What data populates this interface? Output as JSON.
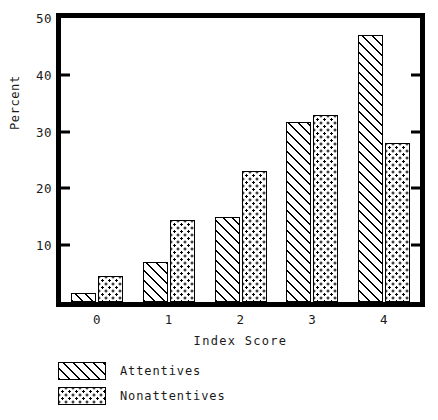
{
  "chart_data": {
    "type": "bar",
    "title": "",
    "xlabel": "Index Score",
    "ylabel": "Percent",
    "categories": [
      "0",
      "1",
      "2",
      "3",
      "4"
    ],
    "series": [
      {
        "name": "Attentives",
        "pattern": "diagonal-hatch",
        "values": [
          1.5,
          7.0,
          15.0,
          31.7,
          47.0
        ]
      },
      {
        "name": "Nonattentives",
        "pattern": "dotted",
        "values": [
          4.5,
          14.5,
          23.0,
          33.0,
          28.0
        ]
      }
    ],
    "ylim": [
      0,
      50
    ],
    "yticks": [
      10,
      20,
      30,
      40,
      50
    ],
    "ytick_labels": [
      "10",
      "20",
      "30",
      "40",
      "50"
    ],
    "xtick_labels": [
      "0",
      "1",
      "2",
      "3",
      "4"
    ],
    "grid": false,
    "legend_position": "below-axis-left",
    "frame_color": "#000000",
    "background_color": "#ffffff"
  },
  "legend": {
    "items": [
      {
        "label": "Attentives"
      },
      {
        "label": "Nonattentives"
      }
    ]
  }
}
